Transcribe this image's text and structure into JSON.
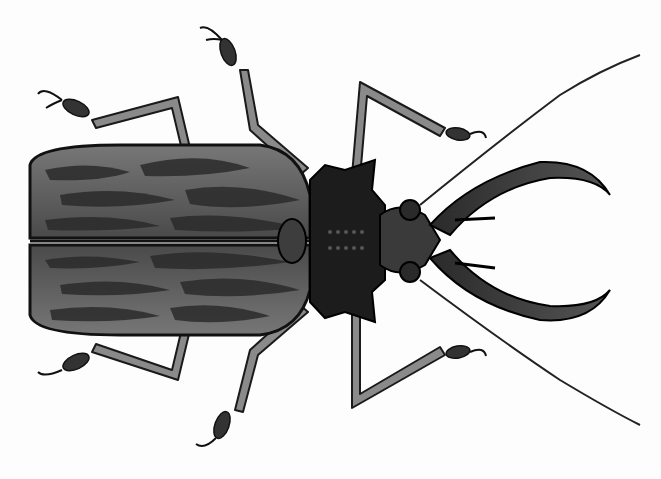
{
  "image": {
    "subject": "Longhorn beetle illustration (top view, grayscale)",
    "background": "#ffffff",
    "colors": {
      "outline": "#111111",
      "elytra": "#5a5a5a",
      "elytra_pattern": "#2b2b2b",
      "elytra_light": "#8a8a8a",
      "thorax": "#1c1c1c",
      "head": "#3a3a3a",
      "legs": "#555555",
      "leg_highlight": "#bdbdbd"
    }
  }
}
